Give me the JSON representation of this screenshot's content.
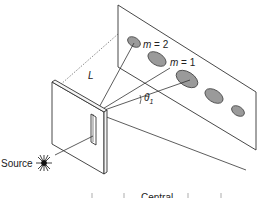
{
  "diagram": {
    "labels": {
      "source": "Source",
      "distance": "L",
      "order_2": "m = 2",
      "order_1": "m = 1",
      "angle": "θ",
      "angle_sub": "1",
      "central": "Central"
    },
    "colors": {
      "line": "#333333",
      "fringe_fill": "#9a9a9a",
      "fringe_stroke": "#444444",
      "background": "#ffffff"
    },
    "components": [
      "light source",
      "slit plate",
      "viewing screen",
      "diffraction fringes"
    ]
  }
}
